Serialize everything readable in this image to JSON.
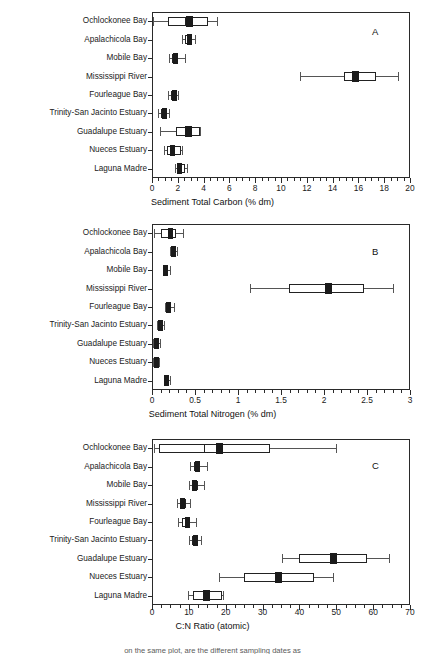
{
  "figure": {
    "categories": [
      "Ochlockonee Bay",
      "Apalachicola Bay",
      "Mobile Bay",
      "Mississippi River",
      "Fourleague  Bay",
      "Trinity-San Jacinto Estuary",
      "Guadalupe Estuary",
      "Nueces Estuary",
      "Laguna Madre"
    ],
    "caption_fragment": "on the same plot, are the different sampling dates as"
  },
  "chart_data": [
    {
      "type": "box",
      "panel_letter": "A",
      "title": "",
      "xlabel": "Sediment Total Carbon  (% dm)",
      "ylabel": "",
      "xlim": [
        0,
        20
      ],
      "xticks": [
        0,
        2,
        4,
        6,
        8,
        10,
        12,
        14,
        16,
        18,
        20
      ],
      "xtick_labels": [
        "0",
        "2",
        "4",
        "6",
        "8",
        "10",
        "12",
        "14",
        "16",
        "18",
        "20"
      ],
      "minor_tick_step": 0.5,
      "grid": false,
      "categories": [
        "Ochlockonee Bay",
        "Apalachicola Bay",
        "Mobile Bay",
        "Mississippi River",
        "Fourleague  Bay",
        "Trinity-San Jacinto Estuary",
        "Guadalupe Estuary",
        "Nueces Estuary",
        "Laguna Madre"
      ],
      "boxes": [
        {
          "category": "Ochlockonee Bay",
          "whisker_low": 0.1,
          "q1": 1.25,
          "median": 2.55,
          "mean": 2.9,
          "q3": 4.35,
          "whisker_high": 5.05
        },
        {
          "category": "Apalachicola Bay",
          "whisker_low": 2.35,
          "q1": 2.55,
          "median": 2.85,
          "mean": 2.9,
          "q3": 3.05,
          "whisker_high": 3.35
        },
        {
          "category": "Mobile Bay",
          "whisker_low": 1.35,
          "q1": 1.55,
          "median": 1.8,
          "mean": 1.85,
          "q3": 2.0,
          "whisker_high": 2.55
        },
        {
          "category": "Mississippi River",
          "whisker_low": 11.45,
          "q1": 14.85,
          "median": 15.75,
          "mean": 15.75,
          "q3": 17.4,
          "whisker_high": 19.05
        },
        {
          "category": "Fourleague  Bay",
          "whisker_low": 1.25,
          "q1": 1.45,
          "median": 1.7,
          "mean": 1.75,
          "q3": 1.95,
          "whisker_high": 2.05
        },
        {
          "category": "Trinity-San Jacinto Estuary",
          "whisker_low": 0.5,
          "q1": 0.7,
          "median": 0.95,
          "mean": 0.95,
          "q3": 1.15,
          "whisker_high": 1.3
        },
        {
          "category": "Guadalupe Estuary",
          "whisker_low": 0.6,
          "q1": 1.85,
          "median": 2.55,
          "mean": 2.8,
          "q3": 3.7,
          "whisker_high": 3.7
        },
        {
          "category": "Nueces Estuary",
          "whisker_low": 0.9,
          "q1": 1.15,
          "median": 1.6,
          "mean": 1.6,
          "q3": 2.25,
          "whisker_high": 2.3
        },
        {
          "category": "Laguna Madre",
          "whisker_low": 1.8,
          "q1": 1.95,
          "median": 2.15,
          "mean": 2.15,
          "q3": 2.55,
          "whisker_high": 2.75
        }
      ]
    },
    {
      "type": "box",
      "panel_letter": "B",
      "title": "",
      "xlabel": "Sediment Total Nitrogen  (% dm)",
      "ylabel": "",
      "xlim": [
        0,
        3
      ],
      "xticks": [
        0,
        0.5,
        1,
        1.5,
        2,
        2.5,
        3
      ],
      "xtick_labels": [
        "0",
        "0.5",
        "1",
        "1.5",
        "2",
        "2.5",
        "3"
      ],
      "minor_tick_step": 0.1,
      "grid": false,
      "categories": [
        "Ochlockonee Bay",
        "Apalachicola Bay",
        "Mobile Bay",
        "Mississippi River",
        "Fourleague  Bay",
        "Trinity-San Jacinto Estuary",
        "Guadalupe Estuary",
        "Nueces Estuary",
        "Laguna Madre"
      ],
      "boxes": [
        {
          "category": "Ochlockonee Bay",
          "whisker_low": 0.02,
          "q1": 0.1,
          "median": 0.2,
          "mean": 0.215,
          "q3": 0.28,
          "whisker_high": 0.355
        },
        {
          "category": "Apalachicola Bay",
          "whisker_low": 0.215,
          "q1": 0.235,
          "median": 0.255,
          "mean": 0.255,
          "q3": 0.275,
          "whisker_high": 0.295
        },
        {
          "category": "Mobile Bay",
          "whisker_low": 0.125,
          "q1": 0.14,
          "median": 0.16,
          "mean": 0.16,
          "q3": 0.18,
          "whisker_high": 0.205
        },
        {
          "category": "Mississippi River",
          "whisker_low": 1.14,
          "q1": 1.59,
          "median": 2.05,
          "mean": 2.05,
          "q3": 2.46,
          "whisker_high": 2.8
        },
        {
          "category": "Fourleague  Bay",
          "whisker_low": 0.15,
          "q1": 0.175,
          "median": 0.195,
          "mean": 0.195,
          "q3": 0.215,
          "whisker_high": 0.255
        },
        {
          "category": "Trinity-San Jacinto Estuary",
          "whisker_low": 0.055,
          "q1": 0.075,
          "median": 0.095,
          "mean": 0.095,
          "q3": 0.115,
          "whisker_high": 0.135
        },
        {
          "category": "Guadalupe Estuary",
          "whisker_low": 0.01,
          "q1": 0.03,
          "median": 0.055,
          "mean": 0.055,
          "q3": 0.075,
          "whisker_high": 0.095
        },
        {
          "category": "Nueces Estuary",
          "whisker_low": 0.01,
          "q1": 0.03,
          "median": 0.05,
          "mean": 0.05,
          "q3": 0.07,
          "whisker_high": 0.085
        },
        {
          "category": "Laguna Madre",
          "whisker_low": 0.135,
          "q1": 0.15,
          "median": 0.17,
          "mean": 0.17,
          "q3": 0.19,
          "whisker_high": 0.215
        }
      ]
    },
    {
      "type": "box",
      "panel_letter": "C",
      "title": "",
      "xlabel": "C:N Ratio (atomic)",
      "ylabel": "",
      "xlim": [
        0,
        70
      ],
      "xticks": [
        0,
        10,
        20,
        30,
        40,
        50,
        60,
        70
      ],
      "xtick_labels": [
        "0",
        "10",
        "20",
        "30",
        "40",
        "50",
        "60",
        "70"
      ],
      "minor_tick_step": 2.5,
      "grid": false,
      "categories": [
        "Ochlockonee Bay",
        "Apalachicola Bay",
        "Mobile Bay",
        "Mississippi River",
        "Fourleague  Bay",
        "Trinity-San Jacinto Estuary",
        "Guadalupe Estuary",
        "Nueces Estuary",
        "Laguna Madre"
      ],
      "boxes": [
        {
          "category": "Ochlockonee Bay",
          "whisker_low": 0.5,
          "q1": 2.0,
          "median": 14.0,
          "mean": 18.3,
          "q3": 32.0,
          "whisker_high": 49.8
        },
        {
          "category": "Apalachicola Bay",
          "whisker_low": 10.3,
          "q1": 11.3,
          "median": 12.2,
          "mean": 12.3,
          "q3": 13.1,
          "whisker_high": 14.8
        },
        {
          "category": "Mobile Bay",
          "whisker_low": 10.0,
          "q1": 10.8,
          "median": 11.5,
          "mean": 11.6,
          "q3": 12.4,
          "whisker_high": 14.2
        },
        {
          "category": "Mississippi River",
          "whisker_low": 6.8,
          "q1": 7.6,
          "median": 8.4,
          "mean": 8.4,
          "q3": 9.3,
          "whisker_high": 10.4
        },
        {
          "category": "Fourleague  Bay",
          "whisker_low": 7.0,
          "q1": 8.2,
          "median": 9.2,
          "mean": 9.5,
          "q3": 10.4,
          "whisker_high": 12.0
        },
        {
          "category": "Trinity-San Jacinto Estuary",
          "whisker_low": 10.0,
          "q1": 10.8,
          "median": 11.6,
          "mean": 11.7,
          "q3": 12.5,
          "whisker_high": 13.3
        },
        {
          "category": "Guadalupe Estuary",
          "whisker_low": 35.2,
          "q1": 39.8,
          "median": 49.2,
          "mean": 49.2,
          "q3": 58.4,
          "whisker_high": 64.2
        },
        {
          "category": "Nueces Estuary",
          "whisker_low": 18.2,
          "q1": 25.0,
          "median": 34.2,
          "mean": 34.2,
          "q3": 44.0,
          "whisker_high": 49.0
        },
        {
          "category": "Laguna Madre",
          "whisker_low": 9.8,
          "q1": 11.0,
          "median": 14.8,
          "mean": 14.8,
          "q3": 19.0,
          "whisker_high": 19.2
        }
      ]
    }
  ]
}
